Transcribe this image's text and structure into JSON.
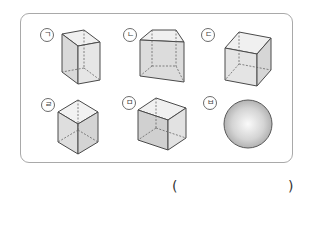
{
  "question": {
    "options": [
      {
        "label": "㉠",
        "marker": "ㄱ",
        "shape": "rectangular-prism"
      },
      {
        "label": "㉡",
        "marker": "ㄴ",
        "shape": "truncated-prism"
      },
      {
        "label": "㉢",
        "marker": "ㄷ",
        "shape": "cube"
      },
      {
        "label": "㉣",
        "marker": "ㄹ",
        "shape": "cube-vertex-view"
      },
      {
        "label": "㉤",
        "marker": "ㅁ",
        "shape": "rectangular-prism-wide"
      },
      {
        "label": "㉥",
        "marker": "ㅂ",
        "shape": "sphere"
      }
    ],
    "answer": {
      "open": "(",
      "close": ")",
      "value": ""
    }
  },
  "colors": {
    "border": "#a9a9a9",
    "edge": "#4a4a4a",
    "face_light": "#efefef",
    "face_mid": "#e0e0e0",
    "face_dark": "#d2d2d2"
  }
}
